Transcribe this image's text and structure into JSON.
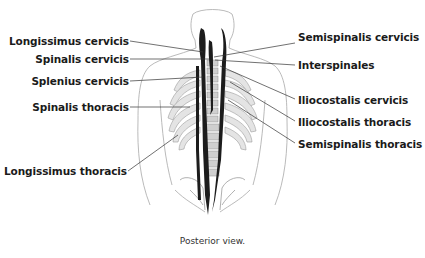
{
  "diagram": {
    "view": "posterior",
    "caption": "Posterior view.",
    "labels_left": [
      {
        "text": "Longissimus cervicis"
      },
      {
        "text": "Spinalis cervicis"
      },
      {
        "text": "Splenius cervicis"
      },
      {
        "text": "Spinalis thoracis"
      },
      {
        "text": "Longissimus thoracis"
      }
    ],
    "labels_right": [
      {
        "text": "Semispinalis cervicis"
      },
      {
        "text": "Interspinales"
      },
      {
        "text": "Iliocostalis cervicis"
      },
      {
        "text": "Iliocostalis thoracis"
      },
      {
        "text": "Semispinalis thoracis"
      }
    ],
    "colors": {
      "muscle": "#1c1c1c",
      "outline": "#9a9a9a",
      "bone": "#d8d8d8",
      "leader": "#333333"
    }
  }
}
